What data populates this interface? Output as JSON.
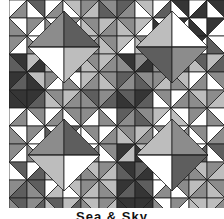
{
  "caption": "Sea & Sky",
  "palette": {
    "white": "#ffffff",
    "light": "#bdbdbd",
    "mid": "#8c8c8c",
    "dark": "#5e5e5e",
    "darkest": "#353535",
    "seam": "#1e1e1e"
  },
  "quilt": {
    "cell": 18,
    "cols": 12,
    "rows": 12,
    "diamonds": [
      {
        "cx": 55,
        "cy": 47,
        "r": 36,
        "quarters": [
          "mid",
          "dark",
          "white",
          "light"
        ]
      },
      {
        "cx": 163,
        "cy": 47,
        "r": 36,
        "quarters": [
          "light",
          "white",
          "dark",
          "mid"
        ]
      },
      {
        "cx": 55,
        "cy": 155,
        "r": 36,
        "quarters": [
          "mid",
          "dark",
          "light",
          "white"
        ]
      },
      {
        "cx": 163,
        "cy": 155,
        "r": 36,
        "quarters": [
          "light",
          "mid",
          "white",
          "dark"
        ]
      }
    ],
    "cells": [
      [
        "white",
        "dark",
        "white",
        "light",
        "mid",
        "mid",
        "dark",
        "light",
        "white",
        "darkest",
        "white",
        "darkest"
      ],
      [
        "white",
        "mid",
        "white",
        "mid",
        "mid",
        "light",
        "mid",
        "light",
        "white",
        "darkest",
        "white",
        "darkest"
      ],
      [
        "mid",
        "white",
        "dark",
        "mid",
        "light",
        "mid",
        "light",
        "mid",
        "dark",
        "white",
        "darkest",
        "white"
      ],
      [
        "darkest",
        "light",
        "dark",
        "light",
        "mid",
        "light",
        "darkest",
        "mid",
        "dark",
        "mid",
        "dark",
        "light"
      ],
      [
        "darkest",
        "light",
        "mid",
        "white",
        "light",
        "mid",
        "dark",
        "mid",
        "mid",
        "light",
        "white",
        "mid"
      ],
      [
        "darkest",
        "darkest",
        "mid",
        "light",
        "dark",
        "mid",
        "dark",
        "darkest",
        "mid",
        "white",
        "light",
        "mid"
      ],
      [
        "white",
        "mid",
        "white",
        "mid",
        "mid",
        "white",
        "dark",
        "mid",
        "light",
        "white",
        "mid",
        "white"
      ],
      [
        "white",
        "mid",
        "white",
        "dark",
        "mid",
        "white",
        "mid",
        "light",
        "mid",
        "white",
        "mid",
        "white"
      ],
      [
        "mid",
        "white",
        "mid",
        "white",
        "white",
        "mid",
        "darkest",
        "light",
        "light",
        "mid",
        "white",
        "dark"
      ],
      [
        "dark",
        "white",
        "mid",
        "light",
        "light",
        "mid",
        "darkest",
        "dark",
        "mid",
        "white",
        "light",
        "mid"
      ],
      [
        "mid",
        "dark",
        "white",
        "light",
        "mid",
        "light",
        "darkest",
        "dark",
        "white",
        "mid",
        "light",
        "mid"
      ],
      [
        "dark",
        "mid",
        "dark",
        "light",
        "light",
        "mid",
        "darkest",
        "darkest",
        "white",
        "mid",
        "light",
        "light"
      ]
    ],
    "cell_alt": [
      [
        "mid",
        "white",
        "mid",
        "white",
        "light",
        "dark",
        "mid",
        "white",
        "dark",
        "white",
        "darkest",
        "white"
      ],
      [
        "mid",
        "white",
        "mid",
        "white",
        "light",
        "mid",
        "light",
        "white",
        "darkest",
        "white",
        "darkest",
        "white"
      ],
      [
        "white",
        "mid",
        "white",
        "light",
        "mid",
        "light",
        "white",
        "light",
        "white",
        "darkest",
        "white",
        "dark"
      ],
      [
        "dark",
        "darkest",
        "light",
        "dark",
        "light",
        "mid",
        "mid",
        "darkest",
        "mid",
        "dark",
        "light",
        "dark"
      ],
      [
        "dark",
        "darkest",
        "white",
        "mid",
        "mid",
        "light",
        "mid",
        "dark",
        "light",
        "mid",
        "mid",
        "white"
      ],
      [
        "darkest",
        "dark",
        "light",
        "mid",
        "mid",
        "dark",
        "darkest",
        "dark",
        "white",
        "mid",
        "mid",
        "light"
      ],
      [
        "mid",
        "white",
        "mid",
        "white",
        "white",
        "mid",
        "mid",
        "dark",
        "white",
        "light",
        "white",
        "mid"
      ],
      [
        "mid",
        "white",
        "dark",
        "white",
        "white",
        "mid",
        "light",
        "mid",
        "white",
        "mid",
        "white",
        "mid"
      ],
      [
        "white",
        "mid",
        "white",
        "mid",
        "mid",
        "white",
        "light",
        "darkest",
        "mid",
        "light",
        "dark",
        "white"
      ],
      [
        "white",
        "dark",
        "light",
        "mid",
        "mid",
        "light",
        "dark",
        "darkest",
        "white",
        "mid",
        "mid",
        "light"
      ],
      [
        "dark",
        "mid",
        "light",
        "white",
        "light",
        "mid",
        "dark",
        "darkest",
        "mid",
        "white",
        "mid",
        "light"
      ],
      [
        "mid",
        "dark",
        "light",
        "dark",
        "mid",
        "light",
        "darkest",
        "darkest",
        "mid",
        "white",
        "light",
        "mid"
      ]
    ]
  }
}
